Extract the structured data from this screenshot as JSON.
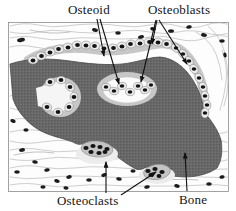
{
  "figure": {
    "type": "labeled-histology-diagram",
    "labels": {
      "osteoid": "Osteoid",
      "osteoblasts": "Osteoblasts",
      "osteoclasts": "Osteoclasts",
      "bone": "Bone"
    },
    "colors": {
      "bone": "#686868",
      "osteoid": "#c7c7c7",
      "cell": "#ececec",
      "nucleus": "#141414",
      "fiber": "#c2c2c2",
      "ink": "#111111",
      "background": "#ffffff"
    }
  }
}
